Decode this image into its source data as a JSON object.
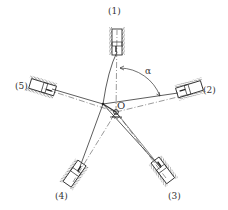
{
  "diagram": {
    "type": "five-cylinder radial engine mechanism",
    "center_label": "O",
    "angle_label": "α",
    "cylinders": [
      {
        "id": 1,
        "label": "(1)",
        "angle_deg": 90
      },
      {
        "id": 2,
        "label": "(2)",
        "angle_deg": 18
      },
      {
        "id": 3,
        "label": "(3)",
        "angle_deg": -54
      },
      {
        "id": 4,
        "label": "(4)",
        "angle_deg": -126
      },
      {
        "id": 5,
        "label": "(5)",
        "angle_deg": 162
      }
    ],
    "colors": {
      "line": "#333333",
      "background": "#ffffff"
    }
  }
}
